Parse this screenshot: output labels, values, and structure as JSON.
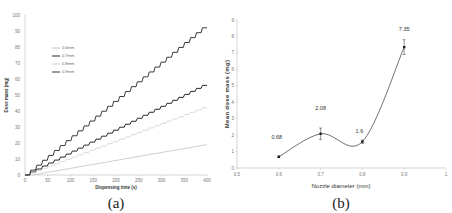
{
  "chart_data": [
    {
      "id": "a",
      "type": "line",
      "caption": "(a)",
      "title": "",
      "xlabel": "Dispensing time (s)",
      "ylabel": "Dose mass (mg)",
      "xlim": [
        0,
        400
      ],
      "ylim": [
        0,
        100
      ],
      "xticks": [
        0,
        50,
        100,
        150,
        200,
        250,
        300,
        350,
        400
      ],
      "yticks": [
        0,
        10,
        20,
        30,
        40,
        50,
        60,
        70,
        80,
        90,
        100
      ],
      "grid": false,
      "legend_position": "upper-left",
      "series": [
        {
          "name": "0.6mm",
          "color": "#bbbbbb",
          "step": false,
          "x": [
            0,
            400
          ],
          "y": [
            0,
            19
          ]
        },
        {
          "name": "0.7mm",
          "color": "#111111",
          "step": true,
          "x": [
            0,
            400
          ],
          "y": [
            0,
            56
          ]
        },
        {
          "name": "0.8mm",
          "color": "#cccccc",
          "step": true,
          "x": [
            0,
            400
          ],
          "y": [
            0,
            42
          ]
        },
        {
          "name": "0.9mm",
          "color": "#222222",
          "step": true,
          "x": [
            0,
            400
          ],
          "y": [
            0,
            92
          ]
        }
      ]
    },
    {
      "id": "b",
      "type": "line",
      "caption": "(b)",
      "title": "",
      "xlabel": "Nozzle diameter (mm)",
      "ylabel": "Mean dose mass (mg)",
      "xlim": [
        0.5,
        1
      ],
      "ylim": [
        0,
        9
      ],
      "xticks": [
        "0.5",
        "0.6",
        "0.7",
        "0.8",
        "0.9",
        "1"
      ],
      "yticks": [
        0,
        1,
        2,
        3,
        4,
        5,
        6,
        7,
        8,
        9
      ],
      "grid": false,
      "smooth": true,
      "series": [
        {
          "name": "Mean dose mass",
          "color": "#333333",
          "x": [
            0.6,
            0.7,
            0.8,
            0.9
          ],
          "y": [
            0.68,
            2.08,
            1.6,
            7.35
          ],
          "labels": [
            "0.68",
            "2.08",
            "1.6",
            "7.35"
          ],
          "error": [
            0.05,
            0.35,
            0.1,
            0.45
          ]
        }
      ]
    }
  ]
}
